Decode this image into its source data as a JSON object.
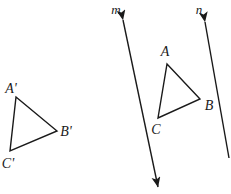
{
  "diagram": {
    "stroke_color": "#1a1a1a",
    "background_color": "#ffffff",
    "shapes": {
      "preimage_triangle": {
        "name": "triangle-a-prime-b-prime-c-prime",
        "vertices": [
          {
            "label": "A'",
            "x": 16,
            "y": 97,
            "label_x": 11,
            "label_y": 93
          },
          {
            "label": "B'",
            "x": 57,
            "y": 131,
            "label_x": 61,
            "label_y": 136
          },
          {
            "label": "C'",
            "x": 10,
            "y": 151,
            "label_x": 3,
            "label_y": 168
          }
        ],
        "path": "M 16 97 L 57 131 L 10 151 Z"
      },
      "image_triangle": {
        "name": "triangle-a-b-c",
        "vertices": [
          {
            "label": "A",
            "x": 167,
            "y": 64,
            "label_x": 161,
            "label_y": 56
          },
          {
            "label": "B",
            "x": 200,
            "y": 99,
            "label_x": 204,
            "label_y": 109
          },
          {
            "label": "C",
            "x": 158,
            "y": 118,
            "label_x": 152,
            "label_y": 134
          }
        ],
        "path": "M 167 64 L 200 99 L 158 118 Z"
      }
    },
    "lines": [
      {
        "id": "line-m",
        "label": "m",
        "label_x": 116,
        "label_y": 14,
        "x1": 123,
        "y1": 20,
        "x2": 158,
        "y2": 187,
        "arrow_start": true,
        "arrow_end": true
      },
      {
        "id": "line-n",
        "label": "n",
        "label_x": 199,
        "label_y": 14,
        "x1": 205,
        "y1": 22,
        "x2": 229,
        "y2": 158,
        "arrow_start": true,
        "arrow_end": false
      }
    ]
  }
}
